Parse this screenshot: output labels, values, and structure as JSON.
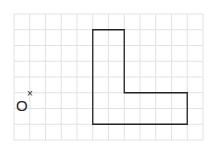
{
  "diagram": {
    "type": "grid-shape",
    "grid": {
      "x0": 14,
      "y0": 14,
      "cell": 15.75,
      "cols": 12,
      "rows": 8,
      "line_color": "#e2e2e2"
    },
    "shape": {
      "name": "L-shape",
      "points_grid": [
        [
          5,
          1
        ],
        [
          7,
          1
        ],
        [
          7,
          5
        ],
        [
          11,
          5
        ],
        [
          11,
          7
        ],
        [
          5,
          7
        ]
      ],
      "stroke": "#222222"
    },
    "center_point": {
      "label": "O",
      "marker": "×",
      "grid": [
        1,
        5
      ]
    }
  }
}
